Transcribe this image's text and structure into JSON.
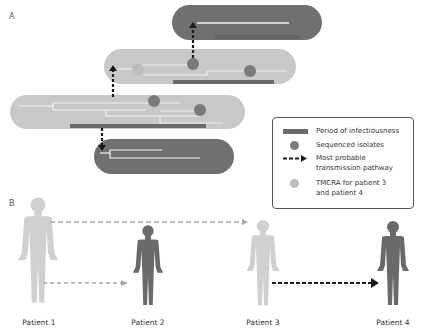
{
  "panels": {
    "a_label": "A",
    "b_label": "B"
  },
  "colors": {
    "dark_pill": "#707070",
    "light_pill": "#c8c8c8",
    "infectious_bar": "#6a6a6a",
    "isolate_dot": "#7a7a7a",
    "tmrca_dot": "#bdbdbd",
    "arrow_dark": "#1a1a1a",
    "arrow_light": "#a8a8a8",
    "patient_light": "#d0d0d0",
    "patient_dark": "#6a6a6a",
    "tree_line": "#f2f2f2"
  },
  "legend": {
    "items": [
      {
        "icon": "infectious-period-bar-icon",
        "label": "Period of infectiousness"
      },
      {
        "icon": "sequenced-isolate-dot-icon",
        "label": "Sequenced isolates"
      },
      {
        "icon": "dashed-arrow-icon",
        "label": "Most probable",
        "label2": "transmission pathway"
      },
      {
        "icon": "tmrca-dot-icon",
        "label": "TMCRA for patient 3",
        "label2": "and patient 4"
      }
    ]
  },
  "patients": [
    {
      "label": "Patient 1",
      "shade": "light"
    },
    {
      "label": "Patient 2",
      "shade": "dark"
    },
    {
      "label": "Patient 3",
      "shade": "light"
    },
    {
      "label": "Patient 4",
      "shade": "dark"
    }
  ]
}
